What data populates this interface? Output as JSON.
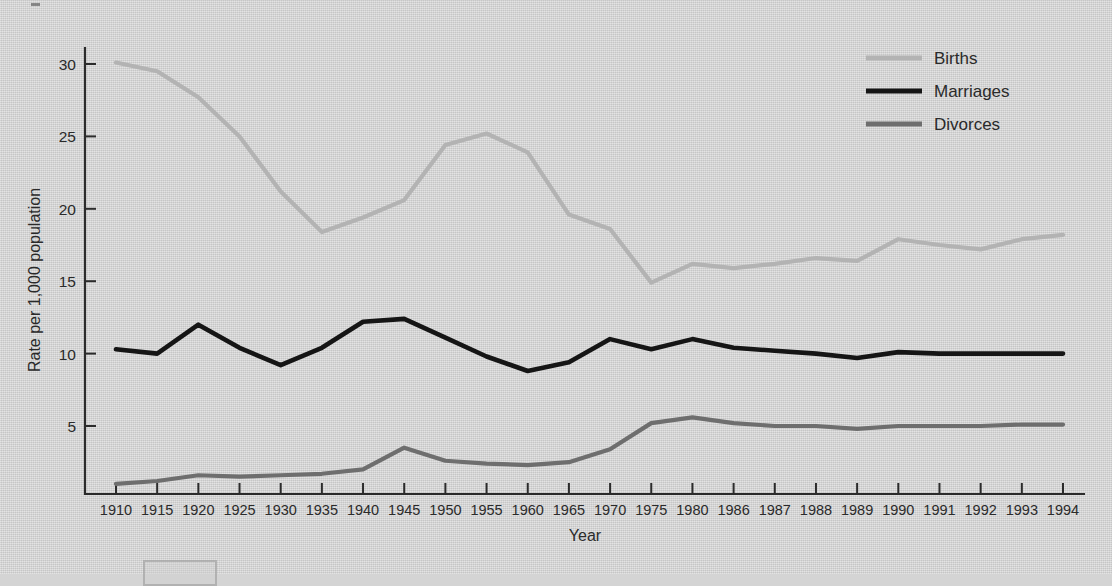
{
  "chart_data": {
    "type": "line",
    "title": "",
    "xlabel": "Year",
    "ylabel": "Rate per 1,000 population",
    "categories": [
      "1910",
      "1915",
      "1920",
      "1925",
      "1930",
      "1935",
      "1940",
      "1945",
      "1950",
      "1955",
      "1960",
      "1965",
      "1970",
      "1975",
      "1980",
      "1986",
      "1987",
      "1988",
      "1989",
      "1990",
      "1991",
      "1992",
      "1993",
      "1994"
    ],
    "x_tick_labels": [
      "1910",
      "1915",
      "1920",
      "1925",
      "1930",
      "1935",
      "1940",
      "1945",
      "1950",
      "1955",
      "1960",
      "1965",
      "1970",
      "1975",
      "1980",
      "1986",
      "1987",
      "1988",
      "1989",
      "1990",
      "1991",
      "1992",
      "1993",
      "1994"
    ],
    "y_tick_labels": [
      "5",
      "10",
      "15",
      "20",
      "25",
      "30"
    ],
    "y_ticks": [
      5,
      10,
      15,
      20,
      25,
      30
    ],
    "ylim": [
      0,
      32
    ],
    "grid": false,
    "legend_position": "top-right",
    "series": [
      {
        "name": "Births",
        "color": "#b3b3b3",
        "values": [
          30.1,
          29.5,
          27.7,
          25.1,
          21.3,
          18.4,
          19.4,
          20.4,
          24.1,
          25.0,
          23.7,
          19.4,
          18.4,
          14.8,
          15.9,
          15.6,
          15.7,
          16.0,
          16.4,
          16.7,
          16.3,
          15.9,
          15.5,
          15.2
        ]
      },
      {
        "name": "Marriages",
        "color": "#151515",
        "values": [
          10.3,
          10.0,
          12.0,
          10.3,
          9.2,
          10.4,
          12.1,
          12.2,
          11.1,
          9.3,
          8.5,
          9.3,
          10.6,
          10.0,
          10.6,
          10.0,
          9.9,
          9.8,
          9.7,
          9.8,
          9.4,
          9.3,
          9.0,
          9.1
        ]
      },
      {
        "name": "Divorces",
        "color": "#6e6e6e",
        "values": [
          0.9,
          1.0,
          1.6,
          1.5,
          1.6,
          1.7,
          2.0,
          3.5,
          2.6,
          2.3,
          2.2,
          2.5,
          3.5,
          4.8,
          5.2,
          4.8,
          4.8,
          4.8,
          4.7,
          4.7,
          4.7,
          4.8,
          4.6,
          4.6
        ]
      }
    ],
    "series_plot_values": {
      "Births": [
        30.1,
        29.5,
        27.7,
        25.0,
        21.2,
        18.4,
        19.4,
        20.6,
        24.4,
        25.2,
        23.9,
        19.6,
        18.6,
        14.9,
        16.2,
        15.9,
        16.2,
        16.6,
        16.4,
        17.9,
        17.5,
        17.2,
        17.9,
        18.2
      ],
      "Marriages": [
        10.3,
        10.0,
        12.0,
        10.4,
        9.2,
        10.4,
        12.2,
        12.4,
        11.1,
        9.8,
        8.8,
        9.4,
        11.0,
        10.3,
        11.0,
        10.4,
        10.2,
        10.0,
        9.7,
        10.1,
        10.0,
        10.0,
        10.0,
        10.0
      ],
      "Divorces": [
        1.0,
        1.2,
        1.6,
        1.5,
        1.6,
        1.7,
        2.0,
        3.5,
        2.6,
        2.4,
        2.3,
        2.5,
        3.4,
        5.2,
        5.6,
        5.2,
        5.0,
        5.0,
        4.8,
        5.0,
        5.0,
        5.0,
        5.1,
        5.1
      ]
    }
  },
  "legend": {
    "items": [
      {
        "label": "Births",
        "color": "#b3b3b3",
        "thickness": 5
      },
      {
        "label": "Marriages",
        "color": "#151515",
        "thickness": 5
      },
      {
        "label": "Divorces",
        "color": "#6e6e6e",
        "thickness": 5
      }
    ]
  },
  "axes": {
    "y_title": "Rate per 1,000 population",
    "x_title": "Year"
  }
}
